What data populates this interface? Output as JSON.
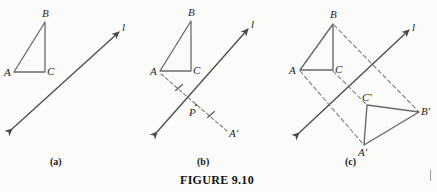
{
  "figure": {
    "title": "FIGURE 9.10",
    "background_color": "#fbfbfa",
    "stroke_color": "#6a6a6a",
    "label_color": "#1d1d1d",
    "panels": [
      {
        "caption": "(a)",
        "description": "Triangle ABC and line l",
        "labels": {
          "vertex_a": "A",
          "vertex_b": "B",
          "vertex_c": "C",
          "line": "l"
        }
      },
      {
        "caption": "(b)",
        "description": "Perpendicular from A through line l to image point A-prime with congruence ticks at P",
        "labels": {
          "vertex_a": "A",
          "vertex_b": "B",
          "vertex_c": "C",
          "line": "l",
          "intersection": "P",
          "image_a": "A'"
        }
      },
      {
        "caption": "(c)",
        "description": "Complete reflection of triangle ABC across line l onto triangle A-prime B-prime C-prime",
        "labels": {
          "vertex_a": "A",
          "vertex_b": "B",
          "vertex_c": "C",
          "line": "l",
          "image_a": "A'",
          "image_b": "B'",
          "image_c": "C'"
        }
      }
    ]
  },
  "geometry": {
    "panel_a": {
      "triangle": {
        "A": [
          14,
          72
        ],
        "B": [
          45,
          22
        ],
        "C": [
          45,
          72
        ]
      },
      "line": {
        "from": [
          12,
          129
        ],
        "to": [
          119,
          32
        ]
      }
    },
    "panel_b": {
      "triangle": {
        "A": [
          160,
          71
        ],
        "B": [
          191,
          21
        ],
        "C": [
          191,
          71
        ]
      },
      "line": {
        "from": [
          157,
          132
        ],
        "to": [
          248,
          29
        ]
      },
      "P": [
        196,
        105
      ],
      "A_image": [
        227,
        132
      ]
    },
    "panel_c": {
      "triangle": {
        "A": [
          300,
          70
        ],
        "B": [
          333,
          24
        ],
        "C": [
          333,
          70
        ]
      },
      "image_triangle": {
        "A": [
          364,
          145
        ],
        "B": [
          419,
          112
        ],
        "C": [
          367,
          105
        ]
      },
      "line": {
        "from": [
          299,
          133
        ],
        "to": [
          409,
          30
        ]
      }
    }
  }
}
